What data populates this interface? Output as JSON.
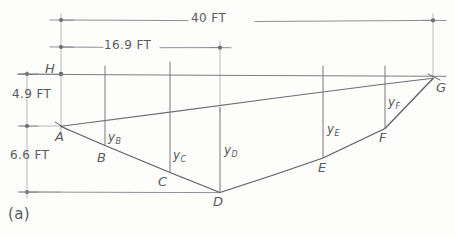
{
  "figure": {
    "caption": "(a)",
    "type": "cable-sag-engineering-sketch"
  },
  "dimensions": [
    {
      "id": "span-total",
      "label": "40 FT",
      "orientation": "horizontal",
      "from_x": 61,
      "to_x": 433,
      "y": 20
    },
    {
      "id": "span-to-low",
      "label": "16.9 FT",
      "orientation": "horizontal",
      "from_x": 61,
      "to_x": 220,
      "y": 47
    },
    {
      "id": "rise-upper",
      "label": "4.9 FT",
      "orientation": "vertical",
      "x": 27,
      "from_y": 74,
      "to_y": 126
    },
    {
      "id": "sag-lower",
      "label": "6.6 FT",
      "orientation": "vertical",
      "x": 27,
      "from_y": 126,
      "to_y": 192
    }
  ],
  "points": [
    {
      "name": "H",
      "x": 61,
      "y": 74
    },
    {
      "name": "A",
      "x": 61,
      "y": 126
    },
    {
      "name": "B",
      "x": 105,
      "y": 145
    },
    {
      "name": "C",
      "x": 170,
      "y": 172
    },
    {
      "name": "D",
      "x": 220,
      "y": 192
    },
    {
      "name": "E",
      "x": 323,
      "y": 158
    },
    {
      "name": "F",
      "x": 385,
      "y": 128
    },
    {
      "name": "G",
      "x": 433,
      "y": 78
    }
  ],
  "ordinates": [
    {
      "id": "yB",
      "label": "y",
      "sub": "B",
      "x": 105,
      "top_y": 137,
      "bottom_y": 145
    },
    {
      "id": "yC",
      "label": "y",
      "sub": "C",
      "x": 170,
      "top_y": 110,
      "bottom_y": 172
    },
    {
      "id": "yD",
      "label": "y",
      "sub": "D",
      "x": 220,
      "top_y": 108,
      "bottom_y": 192
    },
    {
      "id": "yE",
      "label": "y",
      "sub": "E",
      "x": 323,
      "top_y": 92,
      "bottom_y": 158
    },
    {
      "id": "yF",
      "label": "y",
      "sub": "F",
      "x": 385,
      "top_y": 83,
      "bottom_y": 128
    }
  ],
  "colors": {
    "pencil": "#6b6b6e",
    "pencil_light": "#97979a",
    "paper": "#fdfdfc"
  }
}
